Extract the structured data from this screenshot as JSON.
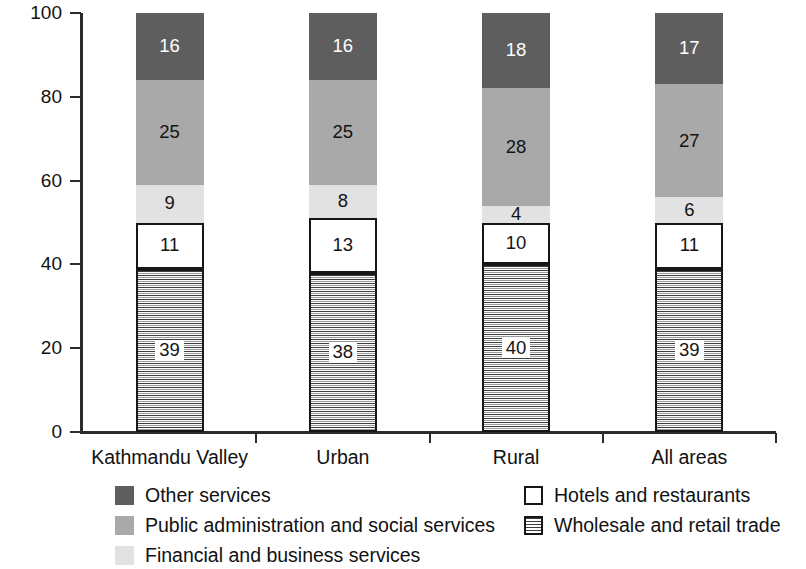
{
  "chart_data": {
    "type": "bar",
    "subtype": "stacked-bar-100",
    "title": "",
    "xlabel": "",
    "ylabel": "Share of service employment (%)",
    "ylim": [
      0,
      100
    ],
    "yticks": [
      0,
      20,
      40,
      60,
      80,
      100
    ],
    "ytick_labels": [
      "0",
      "20",
      "40",
      "60",
      "80",
      "100"
    ],
    "grid": false,
    "legend_position": "bottom",
    "stack_order_bottom_to_top": [
      "Wholesale and retail trade",
      "Hotels and restaurants",
      "Financial and business services",
      "Public administration and social services",
      "Other services"
    ],
    "categories": [
      "Kathmandu Valley",
      "Urban",
      "Rural",
      "All areas"
    ],
    "series": [
      {
        "name": "Wholesale and retail trade",
        "key": "wholesale",
        "fill": "horizontal-hatch",
        "color": "#ffffff",
        "values": [
          39,
          38,
          40,
          39
        ]
      },
      {
        "name": "Hotels and restaurants",
        "key": "hotels",
        "fill": "solid-outlined",
        "color": "#ffffff",
        "values": [
          11,
          13,
          10,
          11
        ]
      },
      {
        "name": "Financial and business services",
        "key": "financial",
        "fill": "solid",
        "color": "#e2e2e2",
        "values": [
          9,
          8,
          4,
          6
        ]
      },
      {
        "name": "Public administration and social services",
        "key": "public",
        "fill": "solid",
        "color": "#a9a9a9",
        "values": [
          25,
          25,
          28,
          27
        ]
      },
      {
        "name": "Other services",
        "key": "other",
        "fill": "solid",
        "color": "#5e5e5e",
        "values": [
          16,
          16,
          18,
          17
        ]
      }
    ]
  },
  "axis": {
    "y_title": "Share of service employment (%)",
    "y_tick_labels": [
      "100",
      "80",
      "60",
      "40",
      "20",
      "0"
    ],
    "x_tick_labels": [
      "Kathmandu Valley",
      "Urban",
      "Rural",
      "All areas"
    ]
  },
  "legend": {
    "items": [
      {
        "label": "Other services",
        "key": "other",
        "column": "left",
        "row": 0
      },
      {
        "label": "Public administration and social services",
        "key": "public",
        "column": "left",
        "row": 1
      },
      {
        "label": "Financial and business services",
        "key": "financial",
        "column": "left",
        "row": 2
      },
      {
        "label": "Hotels and restaurants",
        "key": "hotels",
        "column": "right",
        "row": 0
      },
      {
        "label": "Wholesale and retail trade",
        "key": "wholesale",
        "column": "right",
        "row": 1
      }
    ]
  },
  "colors": {
    "other": "#5e5e5e",
    "public": "#a9a9a9",
    "financial": "#e2e2e2",
    "hotels": "#ffffff",
    "wholesale": "#ffffff",
    "axis": "#2b2b2b",
    "text": "#111111"
  }
}
